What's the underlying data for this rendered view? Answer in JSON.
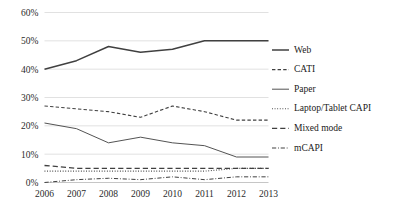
{
  "chart_data": {
    "type": "line",
    "title": "",
    "xlabel": "",
    "ylabel": "",
    "categories": [
      "2006",
      "2007",
      "2008",
      "2009",
      "2010",
      "2011",
      "2012",
      "2013"
    ],
    "x": [
      2006,
      2007,
      2008,
      2009,
      2010,
      2011,
      2012,
      2013
    ],
    "ylim": [
      0,
      60
    ],
    "ytick_values": [
      0,
      10,
      20,
      30,
      40,
      50,
      60
    ],
    "ytick_labels": [
      "0%",
      "10%",
      "20%",
      "30%",
      "40%",
      "50%",
      "60%"
    ],
    "grid": true,
    "legend_position": "right",
    "series": [
      {
        "name": "Web",
        "style": "solid",
        "width": 1.5,
        "color": "#404040",
        "values": [
          40,
          43,
          48,
          46,
          47,
          50,
          50,
          50
        ]
      },
      {
        "name": "CATI",
        "style": "dashed",
        "width": 1.1,
        "color": "#404040",
        "values": [
          27,
          26,
          25,
          23,
          27,
          25,
          22,
          22
        ]
      },
      {
        "name": "Paper",
        "style": "solid",
        "width": 0.9,
        "color": "#595959",
        "values": [
          21,
          19,
          14,
          16,
          14,
          13,
          9,
          9
        ]
      },
      {
        "name": "Laptop/Tablet CAPI",
        "style": "dotted",
        "width": 1.1,
        "color": "#404040",
        "values": [
          4,
          4,
          4,
          4,
          4,
          4,
          5,
          5
        ]
      },
      {
        "name": "Mixed mode",
        "style": "longdash",
        "width": 1.3,
        "color": "#333333",
        "values": [
          6,
          5,
          5,
          5,
          5,
          5,
          5,
          5
        ]
      },
      {
        "name": "mCAPI",
        "style": "dashdot",
        "width": 1.0,
        "color": "#595959",
        "values": [
          0,
          1,
          1.5,
          1,
          2,
          1,
          2,
          2
        ]
      }
    ]
  },
  "legend": {
    "items": [
      {
        "label": "Web",
        "style": "solid-thick"
      },
      {
        "label": "CATI",
        "style": "dashed"
      },
      {
        "label": "Paper",
        "style": "solid-thin"
      },
      {
        "label": "Laptop/Tablet CAPI",
        "style": "dotted"
      },
      {
        "label": "Mixed mode",
        "style": "longdash"
      },
      {
        "label": "mCAPI",
        "style": "dashdot"
      }
    ]
  }
}
